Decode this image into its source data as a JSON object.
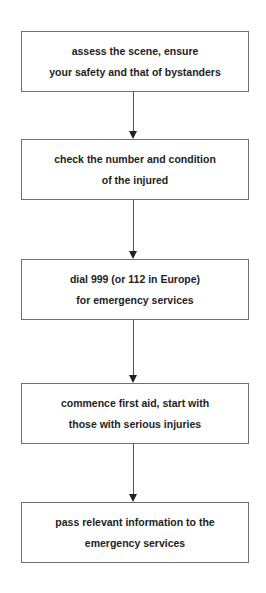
{
  "diagram": {
    "type": "flowchart",
    "direction": "top-to-bottom",
    "steps": [
      {
        "lines": [
          "assess the scene, ensure",
          "your safety and that of bystanders"
        ]
      },
      {
        "lines": [
          "check the number and condition",
          "of the injured"
        ]
      },
      {
        "lines": [
          "dial 999 (or 112 in Europe)",
          "for emergency services"
        ]
      },
      {
        "lines": [
          "commence first aid, start with",
          "those with serious injuries"
        ]
      },
      {
        "lines": [
          "pass relevant information to the",
          "emergency services"
        ]
      }
    ],
    "colors": {
      "background": "#ffffff",
      "border": "#6f6f6f",
      "text": "#1e1e1e",
      "arrow": "#222222"
    }
  }
}
